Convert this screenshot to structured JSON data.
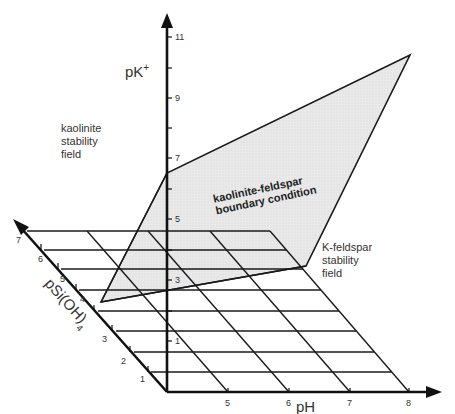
{
  "diagram": {
    "axes": {
      "vertical": {
        "label": "pK",
        "label_sup": "+",
        "ticks": [
          "1",
          "3",
          "5",
          "7",
          "9",
          "11"
        ]
      },
      "horizontal": {
        "label": "pH",
        "ticks": [
          "5",
          "6",
          "7",
          "8"
        ]
      },
      "depth": {
        "label": "pSi(OH)",
        "label_sub": "4",
        "ticks": [
          "1",
          "2",
          "3",
          "4",
          "5",
          "6",
          "7"
        ]
      }
    },
    "regions": {
      "kaolinite": [
        "kaolinite",
        "stability",
        "field"
      ],
      "k_feldspar": [
        "K-feldspar",
        "stability",
        "field"
      ],
      "boundary": [
        "kaolinite-feldspar",
        "boundary condition"
      ]
    },
    "colors": {
      "plane_fill": "#e6e6e6",
      "lines": "#1a1a1a"
    }
  }
}
